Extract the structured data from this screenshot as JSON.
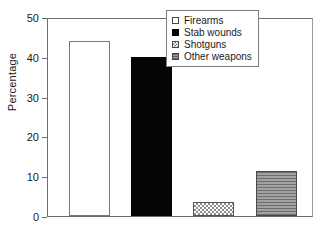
{
  "chart_data": {
    "type": "bar",
    "title": "",
    "xlabel": "",
    "ylabel": "Percentage",
    "ylim": [
      0,
      50
    ],
    "yticks": [
      0,
      10,
      20,
      30,
      40,
      50
    ],
    "ytick_labels": [
      "0",
      "10",
      "20",
      "30",
      "40",
      "50"
    ],
    "grid": false,
    "legend_position": "upper right",
    "categories": [
      "Firearms",
      "Stab wounds",
      "Shotguns",
      "Other weapons"
    ],
    "values": [
      44.0,
      39.9,
      3.5,
      11.3
    ],
    "series": [
      {
        "name": "Percentage",
        "values": [
          44.0,
          39.9,
          3.5,
          11.3
        ]
      }
    ],
    "bars": [
      {
        "label": "Firearms",
        "value": 44.0,
        "fill": "white",
        "edge": "#787878"
      },
      {
        "label": "Stab wounds",
        "value": 39.9,
        "fill": "black",
        "edge": "#050505"
      },
      {
        "label": "Shotguns",
        "value": 3.5,
        "fill": "checkered",
        "edge": "#555555"
      },
      {
        "label": "Other weapons",
        "value": 11.3,
        "fill": "horizontal-lines",
        "edge": "#4a4a4a"
      }
    ]
  },
  "legend": {
    "items": [
      {
        "label": "Firearms",
        "swatch": "white-square-icon"
      },
      {
        "label": "Stab wounds",
        "swatch": "black-square-icon"
      },
      {
        "label": "Shotguns",
        "swatch": "checkered-square-icon"
      },
      {
        "label": "Other weapons",
        "swatch": "gray-hatched-square-icon"
      }
    ]
  },
  "colors": {
    "axis": "#6e6e6e",
    "text": "#1a1a1a",
    "background": "#ffffff",
    "bar_black": "#050505",
    "bar_gray": "#8a8a8a"
  }
}
